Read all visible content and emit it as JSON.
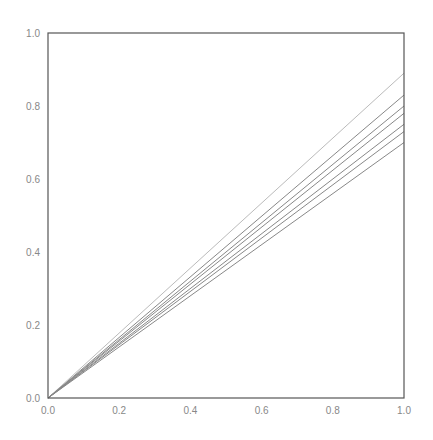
{
  "chart_data": {
    "type": "line",
    "title": "",
    "xlabel": "",
    "ylabel": "",
    "xlim": [
      0.0,
      1.0
    ],
    "ylim": [
      0.0,
      1.0
    ],
    "grid": false,
    "legend": null,
    "x_ticks": [
      "0.0",
      "0.2",
      "0.4",
      "0.6",
      "0.8",
      "1.0"
    ],
    "y_ticks": [
      "0.0",
      "0.2",
      "0.4",
      "0.6",
      "0.8",
      "1.0"
    ],
    "x": [
      0.0,
      1.0
    ],
    "series": [
      {
        "name": "line-1",
        "values": [
          0.0,
          0.89
        ],
        "color": "#bbbbbb"
      },
      {
        "name": "line-2",
        "values": [
          0.0,
          0.83
        ],
        "color": "#888888"
      },
      {
        "name": "line-3",
        "values": [
          0.0,
          0.8
        ],
        "color": "#888888"
      },
      {
        "name": "line-4",
        "values": [
          0.0,
          0.78
        ],
        "color": "#888888"
      },
      {
        "name": "line-5",
        "values": [
          0.0,
          0.75
        ],
        "color": "#888888"
      },
      {
        "name": "line-6",
        "values": [
          0.0,
          0.73
        ],
        "color": "#888888"
      },
      {
        "name": "line-7",
        "values": [
          0.0,
          0.7
        ],
        "color": "#888888"
      }
    ]
  }
}
